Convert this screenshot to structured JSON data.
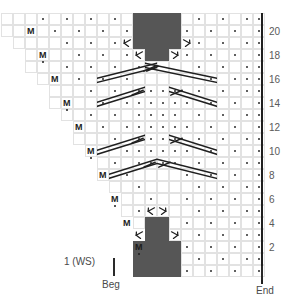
{
  "chart_data": {
    "type": "table",
    "grid": {
      "columns": 22,
      "rows": 22,
      "cell_px": 12
    },
    "row_numbers": [
      "20",
      "18",
      "16",
      "14",
      "12",
      "10",
      "8",
      "6",
      "4",
      "2"
    ],
    "row_number_values": [
      20,
      18,
      16,
      14,
      12,
      10,
      8,
      6,
      4,
      2
    ],
    "legend_notes": "dot = purl, M = make one, filled square = no stitch / dark block, slanted lines = traveling / cable crossings",
    "symbols": {
      "purl": "·",
      "make_one": "M",
      "no_stitch": "filled",
      "left_decrease": "\\",
      "right_decrease": "/"
    }
  },
  "labels": {
    "first_row": "1 (WS)",
    "beg": "Beg",
    "end": "End"
  },
  "markers": {
    "m": "M"
  },
  "colors": {
    "fill": "#565656",
    "grid": "#e2e2e2",
    "ink": "#1f1f1f",
    "rownum": "#5a5a5a",
    "caption": "#4a4a4a"
  }
}
